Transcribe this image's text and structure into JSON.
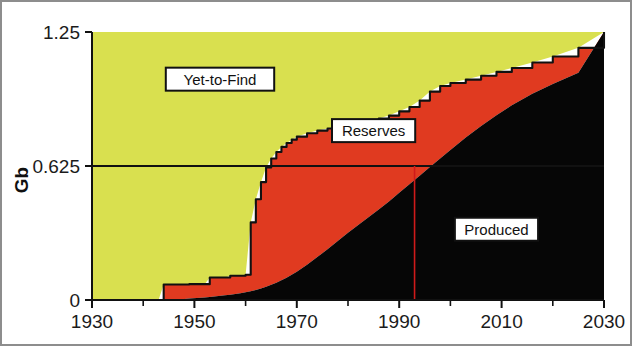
{
  "chart_data": {
    "type": "area",
    "title": "",
    "subtitle": "",
    "xlabel": "",
    "ylabel": "Gb",
    "xlim": [
      1930,
      2030
    ],
    "ylim": [
      0,
      1.25
    ],
    "grid": false,
    "legend_position": "inline-callouts",
    "stacked": true,
    "y_ticks": [
      "0",
      "0.625",
      "1.25"
    ],
    "y_tick_values": [
      0,
      0.625,
      1.25
    ],
    "x_ticks": [
      "1930",
      "1950",
      "1970",
      "1990",
      "2010",
      "2030"
    ],
    "x_tick_values": [
      1930,
      1950,
      1970,
      1990,
      2010,
      2030
    ],
    "x_minor_tick_values": [
      1940,
      1960,
      1980,
      2000,
      2020
    ],
    "colors": {
      "produced": "#060606",
      "reserves": "#e03a20",
      "yet_to_find": "#d9e04f",
      "outline": "#111111",
      "marker_line": "#cf1a1a",
      "reference_line": "#111111",
      "frame": "#8d8d8d",
      "background": "#ffffff"
    },
    "reference_line_y": 0.625,
    "marker_line_x": 1993,
    "x": [
      1930,
      1935,
      1940,
      1943,
      1944,
      1948,
      1949,
      1952,
      1953,
      1956,
      1957,
      1959,
      1960,
      1961,
      1962,
      1963,
      1964,
      1965,
      1966,
      1967,
      1968,
      1969,
      1970,
      1972,
      1974,
      1976,
      1978,
      1980,
      1982,
      1984,
      1986,
      1988,
      1990,
      1992,
      1994,
      1996,
      1998,
      2000,
      2003,
      2006,
      2009,
      2012,
      2016,
      2020,
      2025,
      2030
    ],
    "series": [
      {
        "name": "Produced",
        "label": "Produced",
        "color": "#060606",
        "values": [
          0,
          0,
          0,
          0,
          0,
          0.005,
          0.007,
          0.012,
          0.014,
          0.022,
          0.025,
          0.032,
          0.036,
          0.041,
          0.047,
          0.054,
          0.062,
          0.071,
          0.081,
          0.092,
          0.104,
          0.118,
          0.132,
          0.164,
          0.2,
          0.237,
          0.275,
          0.314,
          0.35,
          0.386,
          0.422,
          0.46,
          0.5,
          0.54,
          0.58,
          0.62,
          0.66,
          0.7,
          0.758,
          0.812,
          0.862,
          0.908,
          0.962,
          1.008,
          1.06,
          1.25
        ]
      },
      {
        "name": "Reserves",
        "label": "Reserves",
        "color": "#e03a20",
        "values": [
          0,
          0,
          0,
          0,
          0.072,
          0.072,
          0.074,
          0.074,
          0.105,
          0.105,
          0.113,
          0.113,
          0.118,
          0.362,
          0.47,
          0.55,
          0.618,
          0.66,
          0.69,
          0.714,
          0.732,
          0.748,
          0.762,
          0.778,
          0.79,
          0.8,
          0.808,
          0.816,
          0.824,
          0.834,
          0.846,
          0.86,
          0.88,
          0.9,
          0.93,
          0.972,
          0.998,
          1.012,
          1.028,
          1.046,
          1.064,
          1.082,
          1.108,
          1.136,
          1.176,
          1.25
        ]
      },
      {
        "name": "Yet-to-Find",
        "label": "Yet-to-Find",
        "color": "#d9e04f",
        "values": [
          1.25,
          1.25,
          1.25,
          1.25,
          1.25,
          1.25,
          1.25,
          1.25,
          1.25,
          1.25,
          1.25,
          1.25,
          1.25,
          1.25,
          1.25,
          1.25,
          1.25,
          1.25,
          1.25,
          1.25,
          1.25,
          1.25,
          1.25,
          1.25,
          1.25,
          1.25,
          1.25,
          1.25,
          1.25,
          1.25,
          1.25,
          1.25,
          1.25,
          1.25,
          1.25,
          1.25,
          1.25,
          1.25,
          1.25,
          1.25,
          1.25,
          1.25,
          1.25,
          1.25,
          1.25,
          1.25
        ]
      }
    ],
    "annotations": [
      {
        "name": "yet-to-find",
        "text": "Yet-to-Find",
        "x": 1955,
        "y": 1.03
      },
      {
        "name": "reserves",
        "text": "Reserves",
        "x": 1985,
        "y": 0.79
      },
      {
        "name": "produced",
        "text": "Produced",
        "x": 2009,
        "y": 0.33
      }
    ]
  }
}
